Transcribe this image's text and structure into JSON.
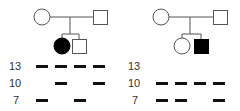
{
  "colors": {
    "line": "#555555",
    "affected": "#000000",
    "unaffected": "#ffffff",
    "band": "#111111",
    "label": "#333333"
  },
  "families": [
    {
      "name": "family-1",
      "parents": [
        {
          "sex": "female",
          "affected": false
        },
        {
          "sex": "male",
          "affected": false
        }
      ],
      "children": [
        {
          "sex": "female",
          "affected": true
        },
        {
          "sex": "male",
          "affected": false
        }
      ],
      "gel": {
        "band_sizes": [
          "13",
          "10",
          "7"
        ],
        "lanes": [
          {
            "member": "mother",
            "bands": [
              "13",
              "7"
            ]
          },
          {
            "member": "father",
            "bands": [
              "13",
              "10"
            ]
          },
          {
            "member": "affected-daughter",
            "bands": [
              "13",
              "7"
            ]
          },
          {
            "member": "son",
            "bands": [
              "13",
              "10"
            ]
          }
        ]
      }
    },
    {
      "name": "family-2",
      "parents": [
        {
          "sex": "female",
          "affected": false
        },
        {
          "sex": "male",
          "affected": false
        }
      ],
      "children": [
        {
          "sex": "female",
          "affected": false
        },
        {
          "sex": "male",
          "affected": true
        }
      ],
      "gel": {
        "band_sizes": [
          "13",
          "10",
          "7"
        ],
        "lanes": [
          {
            "member": "mother",
            "bands": [
              "10",
              "7"
            ]
          },
          {
            "member": "father",
            "bands": [
              "10",
              "7"
            ]
          },
          {
            "member": "daughter",
            "bands": [
              "10"
            ]
          },
          {
            "member": "affected-son",
            "bands": [
              "10",
              "7"
            ]
          }
        ]
      }
    }
  ]
}
